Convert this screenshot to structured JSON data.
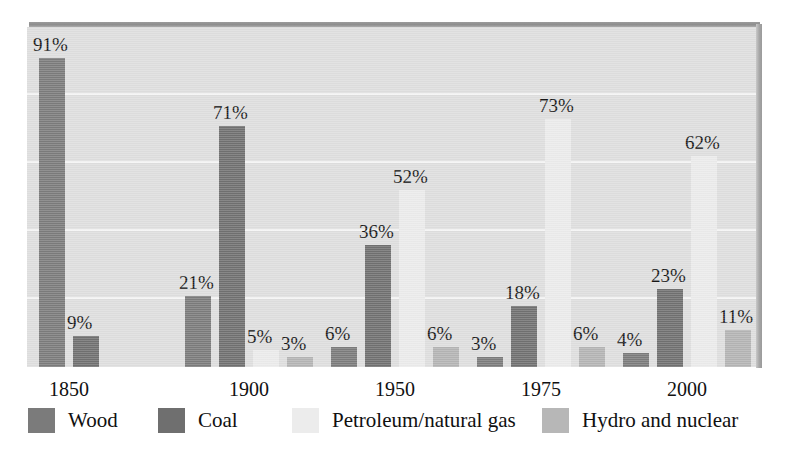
{
  "chart_data": {
    "type": "bar",
    "title": "",
    "subtitle": "",
    "xlabel": "",
    "ylabel": "",
    "ylim": [
      0,
      100
    ],
    "grid": true,
    "legend_position": "bottom",
    "categories": [
      "1850",
      "1900",
      "1950",
      "1975",
      "2000"
    ],
    "series": [
      {
        "name": "Wood",
        "color": "#7b7b7b",
        "values": [
          91,
          21,
          6,
          3,
          4
        ]
      },
      {
        "name": "Coal",
        "color": "#707070",
        "values": [
          9,
          71,
          36,
          18,
          23
        ]
      },
      {
        "name": "Petroleum/natural gas",
        "color": "#ebebeb",
        "values": [
          null,
          5,
          52,
          73,
          62
        ]
      },
      {
        "name": "Hydro and nuclear",
        "color": "#b4b4b4",
        "values": [
          null,
          3,
          6,
          6,
          11
        ]
      }
    ],
    "data_labels": [
      [
        "91%",
        "9%"
      ],
      [
        "21%",
        "71%",
        "5%",
        "3%"
      ],
      [
        "6%",
        "36%",
        "52%",
        "6%"
      ],
      [
        "3%",
        "18%",
        "73%",
        "6%"
      ],
      [
        "4%",
        "23%",
        "62%",
        "11%"
      ]
    ]
  },
  "axis": {
    "x_ticks": [
      "1850",
      "1900",
      "1950",
      "1975",
      "2000"
    ]
  },
  "legend": {
    "items": [
      {
        "label": "Wood",
        "swatch": "wood"
      },
      {
        "label": "Coal",
        "swatch": "coal"
      },
      {
        "label": "Petroleum/natural gas",
        "swatch": "petro"
      },
      {
        "label": "Hydro and nuclear",
        "swatch": "hydro"
      }
    ]
  },
  "colors": {
    "wood": "#7b7b7b",
    "coal": "#707070",
    "petroleum": "#ebebeb",
    "hydro": "#b4b4b4",
    "plot_background": "#dedede",
    "gridline": "#f4f4f4",
    "page_background": "#ffffff"
  }
}
